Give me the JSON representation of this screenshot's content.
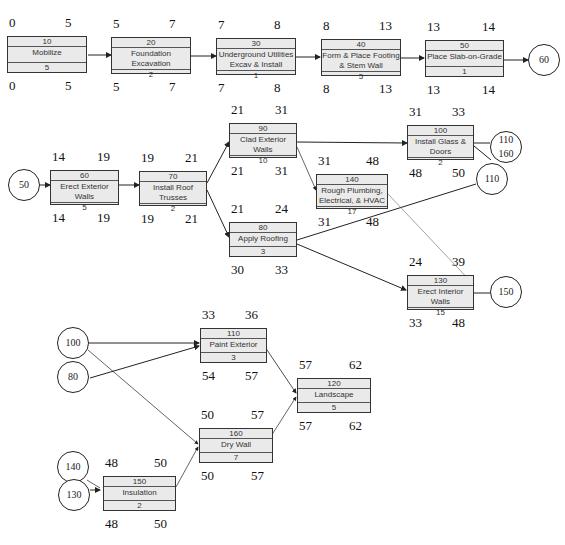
{
  "diagram": {
    "type": "precedence-network",
    "activities": [
      {
        "id": "10",
        "name": "Mobilize",
        "duration": "5",
        "es": "0",
        "ef": "5",
        "ls": "0",
        "lf": "5"
      },
      {
        "id": "20",
        "name": "Foundation Excavation",
        "duration": "2",
        "es": "5",
        "ef": "7",
        "ls": "5",
        "lf": "7"
      },
      {
        "id": "30",
        "name": "Underground Utilities\nExcav & Install",
        "duration": "1",
        "es": "7",
        "ef": "8",
        "ls": "7",
        "lf": "8"
      },
      {
        "id": "40",
        "name": "Form & Place Footing\n& Stem Wall",
        "duration": "5",
        "es": "8",
        "ef": "13",
        "ls": "8",
        "lf": "13"
      },
      {
        "id": "50",
        "name": "Place Slab-on-Grade",
        "duration": "1",
        "es": "13",
        "ef": "14",
        "ls": "13",
        "lf": "14"
      },
      {
        "id": "60",
        "name": "Erect Exterior Walls",
        "duration": "5",
        "es": "14",
        "ef": "19",
        "ls": "14",
        "lf": "19"
      },
      {
        "id": "70",
        "name": "Install Roof Trusses",
        "duration": "2",
        "es": "19",
        "ef": "21",
        "ls": "19",
        "lf": "21"
      },
      {
        "id": "90",
        "name": "Clad Exterior Walls",
        "duration": "10",
        "es": "21",
        "ef": "31",
        "ls": "21",
        "lf": "31"
      },
      {
        "id": "80",
        "name": "Apply Roofing",
        "duration": "3",
        "es": "21",
        "ef": "24",
        "ls": "30",
        "lf": "33"
      },
      {
        "id": "100",
        "name": "Install Glass & Doors",
        "duration": "2",
        "es": "31",
        "ef": "33",
        "ls": "48",
        "lf": "50"
      },
      {
        "id": "140",
        "name": "Rough Plumbing,\nElectrical, & HVAC",
        "duration": "17",
        "es": "31",
        "ef": "48",
        "ls": "31",
        "lf": "48"
      },
      {
        "id": "130",
        "name": "Erect Interior Walls",
        "duration": "15",
        "es": "24",
        "ef": "39",
        "ls": "33",
        "lf": "48"
      },
      {
        "id": "110",
        "name": "Paint Exterior",
        "duration": "3",
        "es": "33",
        "ef": "36",
        "ls": "54",
        "lf": "57"
      },
      {
        "id": "120",
        "name": "Landscape",
        "duration": "5",
        "es": "57",
        "ef": "62",
        "ls": "57",
        "lf": "62"
      },
      {
        "id": "160",
        "name": "Dry Wall",
        "duration": "7",
        "es": "50",
        "ef": "57",
        "ls": "50",
        "lf": "57"
      },
      {
        "id": "150",
        "name": "Insulation",
        "duration": "2",
        "es": "48",
        "ef": "50",
        "ls": "48",
        "lf": "50"
      }
    ],
    "connectors": [
      {
        "key": "c60",
        "label": "60"
      },
      {
        "key": "c50",
        "label": "50"
      },
      {
        "key": "c110_160",
        "label": "110\n160"
      },
      {
        "key": "c110",
        "label": "110"
      },
      {
        "key": "c150",
        "label": "150"
      },
      {
        "key": "c100",
        "label": "100"
      },
      {
        "key": "c80",
        "label": "80"
      },
      {
        "key": "c140",
        "label": "140"
      },
      {
        "key": "c130",
        "label": "130"
      }
    ]
  }
}
